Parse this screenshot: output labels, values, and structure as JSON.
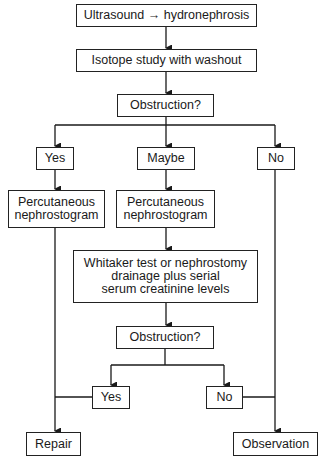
{
  "flowchart": {
    "nodes": {
      "start": "Ultrasound → hydronephrosis",
      "isotope": "Isotope study with washout",
      "obstruction1": "Obstruction?",
      "yes1": "Yes",
      "maybe": "Maybe",
      "no1": "No",
      "perc_left": "Percutaneous\nnephrostogram",
      "perc_mid": "Percutaneous\nnephrostogram",
      "whitaker": "Whitaker test or nephrostomy\ndrainage plus serial\nserum creatinine levels",
      "obstruction2": "Obstruction?",
      "yes2": "Yes",
      "no2": "No",
      "repair": "Repair",
      "observation": "Observation"
    },
    "line_color": "#1a1a1a"
  }
}
